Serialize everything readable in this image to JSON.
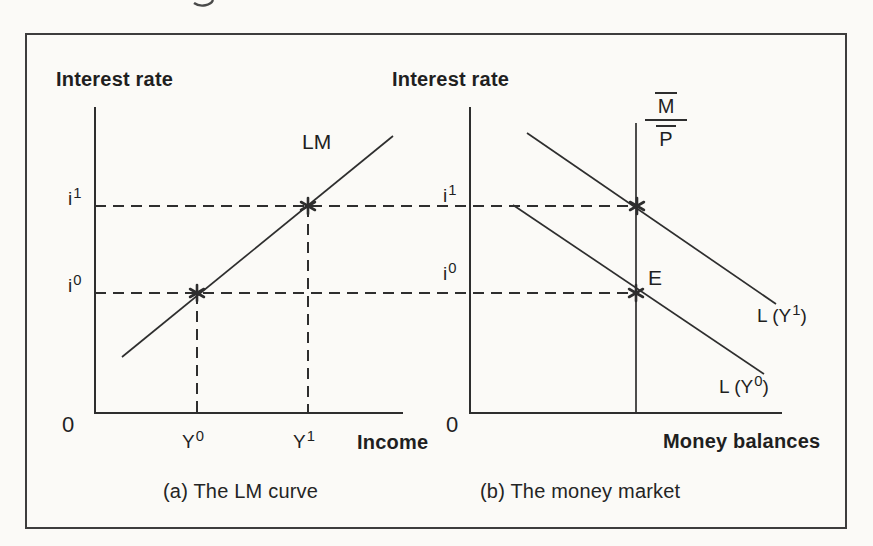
{
  "colors": {
    "line": "#2e2e2e",
    "text": "#1f1f1f",
    "frame": "#3d3d3d",
    "background": "#fbfaf7"
  },
  "panel_a": {
    "title": "Interest rate",
    "origin": "0",
    "xlabel": "Income",
    "curve_label": "LM",
    "caption": "(a) The LM curve",
    "ticks": {
      "i1": {
        "base": "i",
        "sup": "1"
      },
      "i0": {
        "base": "i",
        "sup": "0"
      },
      "y0": {
        "base": "Y",
        "sup": "0"
      },
      "y1": {
        "base": "Y",
        "sup": "1"
      }
    }
  },
  "panel_b": {
    "title": "Interest rate",
    "origin": "0",
    "xlabel": "Money balances",
    "caption": "(b) The money market",
    "equilibrium_label": "E",
    "money_supply": {
      "num": "M",
      "den": "P"
    },
    "ticks": {
      "i1": {
        "base": "i",
        "sup": "1"
      },
      "i0": {
        "base": "i",
        "sup": "0"
      }
    },
    "curve_labels": {
      "l1": {
        "pre": "L (Y",
        "sup": "1",
        "post": ")"
      },
      "l0": {
        "pre": "L (Y",
        "sup": "0",
        "post": ")"
      }
    }
  },
  "chart_data": [
    {
      "type": "line",
      "title": "(a) The LM curve",
      "xlabel": "Income",
      "ylabel": "Interest rate",
      "x_ticks": [
        "Y0",
        "Y1"
      ],
      "y_ticks": [
        "i0",
        "i1"
      ],
      "grid": false,
      "series": [
        {
          "name": "LM",
          "style": "solid",
          "points": [
            [
              "Y0-minus",
              "below-i0"
            ],
            [
              "Y1-plus",
              "above-i1"
            ]
          ],
          "slope": "upward"
        }
      ],
      "markers": [
        {
          "label": "equilibrium",
          "x": "Y0",
          "y": "i0",
          "symbol": "star"
        },
        {
          "label": "equilibrium",
          "x": "Y1",
          "y": "i1",
          "symbol": "star"
        }
      ],
      "guides": [
        "dashed horizontal at i0 and i1",
        "dashed vertical at Y0 and Y1"
      ]
    },
    {
      "type": "line",
      "title": "(b) The money market",
      "xlabel": "Money balances",
      "ylabel": "Interest rate",
      "y_ticks": [
        "i0",
        "i1"
      ],
      "grid": false,
      "series": [
        {
          "name": "M/P",
          "style": "solid",
          "shape": "vertical line",
          "meaning": "fixed real money supply"
        },
        {
          "name": "L (Y1)",
          "style": "solid",
          "slope": "downward",
          "position": "upper demand curve"
        },
        {
          "name": "L (Y0)",
          "style": "solid",
          "slope": "downward",
          "position": "lower demand curve"
        }
      ],
      "markers": [
        {
          "label": "E",
          "x": "M/P",
          "y": "i0",
          "symbol": "star"
        },
        {
          "label": "",
          "x": "M/P",
          "y": "i1",
          "symbol": "star"
        }
      ],
      "guides": [
        "dashed horizontal at i0 and i1 continuing from panel (a)"
      ]
    }
  ],
  "geometry": {
    "canvas": {
      "w": 873,
      "h": 546
    },
    "dash_pattern": "11 7",
    "solid_lines": [
      {
        "name": "panel-a-y-axis",
        "x1": 95,
        "y1": 107,
        "x2": 95,
        "y2": 414,
        "w": 2
      },
      {
        "name": "panel-a-x-axis",
        "x1": 94,
        "y1": 413,
        "x2": 403,
        "y2": 413,
        "w": 2
      },
      {
        "name": "panel-b-y-axis",
        "x1": 470,
        "y1": 107,
        "x2": 470,
        "y2": 414,
        "w": 2
      },
      {
        "name": "panel-b-x-axis",
        "x1": 469,
        "y1": 413,
        "x2": 782,
        "y2": 413,
        "w": 2
      },
      {
        "name": "lm-curve",
        "x1": 122,
        "y1": 357,
        "x2": 393,
        "y2": 136,
        "w": 1.7
      },
      {
        "name": "l-y1-curve",
        "x1": 527,
        "y1": 133,
        "x2": 776,
        "y2": 304,
        "w": 1.7
      },
      {
        "name": "l-y0-curve",
        "x1": 513,
        "y1": 205,
        "x2": 764,
        "y2": 374,
        "w": 1.7
      },
      {
        "name": "money-supply-line",
        "x1": 636,
        "y1": 123,
        "x2": 636,
        "y2": 413,
        "w": 1.7
      }
    ],
    "dashed_lines": [
      {
        "name": "i1-guide",
        "x1": 95,
        "y1": 206,
        "x2": 637,
        "y2": 206
      },
      {
        "name": "i0-guide",
        "x1": 95,
        "y1": 293,
        "x2": 636,
        "y2": 293
      },
      {
        "name": "y0-guide",
        "x1": 197,
        "y1": 293,
        "x2": 197,
        "y2": 412
      },
      {
        "name": "y1-guide",
        "x1": 308,
        "y1": 206,
        "x2": 308,
        "y2": 412
      }
    ],
    "stars": [
      {
        "name": "star-a-y0-i0",
        "cx": 197,
        "cy": 293
      },
      {
        "name": "star-a-y1-i1",
        "cx": 308,
        "cy": 206
      },
      {
        "name": "star-b-i1",
        "cx": 637,
        "cy": 206
      },
      {
        "name": "star-b-e",
        "cx": 636,
        "cy": 293
      }
    ],
    "star_radius": 8,
    "star_stroke": 2.6,
    "artifact_path": "M 213 0 C 211 5 201 8 194 3"
  }
}
